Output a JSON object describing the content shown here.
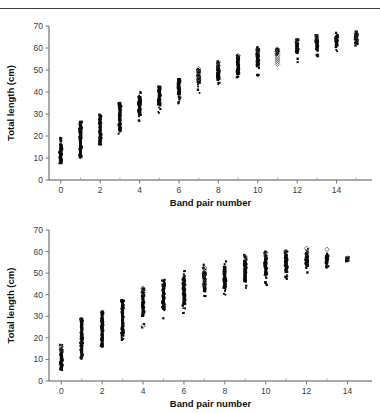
{
  "figure": {
    "background": "#ffffff",
    "rule_color": "#3a3a3a",
    "marker_filled_color": "#0b0b0b",
    "marker_open_color": "#4a4a4a"
  },
  "panels": [
    {
      "id": "top",
      "xlabel": "Band pair number",
      "ylabel": "Total length (cm)",
      "xticks": [
        0,
        2,
        4,
        6,
        8,
        10,
        12,
        14
      ],
      "xminor": [
        1,
        3,
        5,
        7,
        9,
        11,
        13,
        15
      ],
      "yticks": [
        0,
        10,
        20,
        30,
        40,
        50,
        60,
        70
      ],
      "xlim": [
        -0.6,
        15.8
      ],
      "ylim": [
        0,
        70
      ]
    },
    {
      "id": "bottom",
      "xlabel": "Band pair number",
      "ylabel": "Total length (cm)",
      "xticks": [
        0,
        2,
        4,
        6,
        8,
        10,
        12,
        14
      ],
      "xminor": [
        1,
        3,
        5,
        7,
        9,
        11,
        13
      ],
      "yticks": [
        0,
        10,
        20,
        30,
        40,
        50,
        60,
        70
      ],
      "xlim": [
        -0.6,
        15.2
      ],
      "ylim": [
        0,
        70
      ]
    }
  ],
  "chart_data": [
    {
      "type": "scatter",
      "panel": "top",
      "title": "",
      "xlabel": "Band pair number",
      "ylabel": "Total length (cm)",
      "xlim": [
        -0.6,
        15.8
      ],
      "ylim": [
        0,
        70
      ],
      "grid": false,
      "legend": "none",
      "xticks": [
        0,
        2,
        4,
        6,
        8,
        10,
        12,
        14
      ],
      "yticks": [
        0,
        10,
        20,
        30,
        40,
        50,
        60,
        70
      ],
      "notes": "Dense vertical scatter of total length against band pair number; filled squares plus a few open diamonds (notably a column of open diamonds at band pair 11).",
      "series": [
        {
          "name": "filled",
          "marker": "filled-square",
          "columns": [
            {
              "x": 0,
              "min": 7.5,
              "max": 20.0,
              "dense_min": 8.0,
              "dense_max": 16.5,
              "n": 60
            },
            {
              "x": 1,
              "min": 10.0,
              "max": 26.5,
              "dense_min": 10.5,
              "dense_max": 26.0,
              "n": 60
            },
            {
              "x": 2,
              "min": 16.0,
              "max": 30.0,
              "dense_min": 16.5,
              "dense_max": 28.5,
              "n": 60
            },
            {
              "x": 3,
              "min": 20.5,
              "max": 35.0,
              "dense_min": 22.0,
              "dense_max": 34.5,
              "n": 60
            },
            {
              "x": 4,
              "min": 26.5,
              "max": 41.0,
              "dense_min": 29.5,
              "dense_max": 38.0,
              "n": 60
            },
            {
              "x": 5,
              "min": 30.0,
              "max": 42.5,
              "dense_min": 34.0,
              "dense_max": 42.0,
              "n": 60
            },
            {
              "x": 6,
              "min": 34.5,
              "max": 46.0,
              "dense_min": 38.5,
              "dense_max": 45.5,
              "n": 60
            },
            {
              "x": 7,
              "min": 38.0,
              "max": 50.5,
              "dense_min": 44.0,
              "dense_max": 49.5,
              "n": 60
            },
            {
              "x": 8,
              "min": 43.0,
              "max": 54.0,
              "dense_min": 45.5,
              "dense_max": 53.0,
              "n": 60
            },
            {
              "x": 9,
              "min": 45.0,
              "max": 57.5,
              "dense_min": 48.0,
              "dense_max": 56.0,
              "n": 60
            },
            {
              "x": 10,
              "min": 47.0,
              "max": 60.5,
              "dense_min": 51.5,
              "dense_max": 59.5,
              "n": 60
            },
            {
              "x": 11,
              "min": 57.0,
              "max": 60.0,
              "dense_min": 57.5,
              "dense_max": 59.5,
              "n": 20
            },
            {
              "x": 12,
              "min": 52.5,
              "max": 64.0,
              "dense_min": 57.5,
              "dense_max": 63.0,
              "n": 50
            },
            {
              "x": 13,
              "min": 55.5,
              "max": 66.0,
              "dense_min": 59.0,
              "dense_max": 64.5,
              "n": 50
            },
            {
              "x": 14,
              "min": 58.5,
              "max": 67.0,
              "dense_min": 61.0,
              "dense_max": 65.5,
              "n": 50
            },
            {
              "x": 15,
              "min": 60.5,
              "max": 67.5,
              "dense_min": 62.0,
              "dense_max": 66.5,
              "n": 40
            }
          ]
        },
        {
          "name": "open",
          "marker": "open-diamond",
          "points": [
            {
              "x": 7,
              "y": 50.5
            },
            {
              "x": 7,
              "y": 49.0
            },
            {
              "x": 7,
              "y": 47.5
            },
            {
              "x": 7,
              "y": 46.0
            },
            {
              "x": 7,
              "y": 44.5
            },
            {
              "x": 8,
              "y": 53.5
            },
            {
              "x": 8,
              "y": 52.0
            },
            {
              "x": 9,
              "y": 56.5
            },
            {
              "x": 10,
              "y": 59.0
            },
            {
              "x": 11,
              "y": 59.5
            },
            {
              "x": 11,
              "y": 58.5
            },
            {
              "x": 11,
              "y": 57.5
            },
            {
              "x": 11,
              "y": 56.5
            },
            {
              "x": 11,
              "y": 55.5
            },
            {
              "x": 11,
              "y": 54.5
            },
            {
              "x": 11,
              "y": 53.5
            },
            {
              "x": 11,
              "y": 52.5
            },
            {
              "x": 12,
              "y": 63.5
            },
            {
              "x": 13,
              "y": 65.0
            },
            {
              "x": 15,
              "y": 66.5
            },
            {
              "x": 15,
              "y": 64.0
            }
          ]
        }
      ]
    },
    {
      "type": "scatter",
      "panel": "bottom",
      "title": "",
      "xlabel": "Band pair number",
      "ylabel": "Total length (cm)",
      "xlim": [
        -0.6,
        15.2
      ],
      "ylim": [
        0,
        70
      ],
      "grid": false,
      "legend": "none",
      "xticks": [
        0,
        2,
        4,
        6,
        8,
        10,
        12,
        14
      ],
      "yticks": [
        0,
        10,
        20,
        30,
        40,
        50,
        60,
        70
      ],
      "notes": "Second dense vertical scatter, shorter x range ending at band pair 14; filled squares with scattered open diamonds.",
      "series": [
        {
          "name": "filled",
          "marker": "filled-square",
          "columns": [
            {
              "x": 0,
              "min": 5.0,
              "max": 17.0,
              "dense_min": 6.0,
              "dense_max": 14.0,
              "n": 60
            },
            {
              "x": 1,
              "min": 10.0,
              "max": 29.0,
              "dense_min": 10.5,
              "dense_max": 28.5,
              "n": 60
            },
            {
              "x": 2,
              "min": 15.5,
              "max": 32.5,
              "dense_min": 16.5,
              "dense_max": 31.0,
              "n": 60
            },
            {
              "x": 3,
              "min": 19.0,
              "max": 37.5,
              "dense_min": 21.0,
              "dense_max": 37.0,
              "n": 60
            },
            {
              "x": 4,
              "min": 24.5,
              "max": 43.0,
              "dense_min": 30.0,
              "dense_max": 41.5,
              "n": 60
            },
            {
              "x": 5,
              "min": 28.0,
              "max": 47.5,
              "dense_min": 33.0,
              "dense_max": 45.0,
              "n": 60
            },
            {
              "x": 6,
              "min": 31.0,
              "max": 51.5,
              "dense_min": 35.5,
              "dense_max": 48.0,
              "n": 60
            },
            {
              "x": 7,
              "min": 35.5,
              "max": 54.0,
              "dense_min": 41.5,
              "dense_max": 51.0,
              "n": 60
            },
            {
              "x": 8,
              "min": 39.0,
              "max": 55.5,
              "dense_min": 43.0,
              "dense_max": 53.5,
              "n": 60
            },
            {
              "x": 9,
              "min": 41.5,
              "max": 58.5,
              "dense_min": 46.0,
              "dense_max": 56.0,
              "n": 60
            },
            {
              "x": 10,
              "min": 44.0,
              "max": 60.0,
              "dense_min": 49.0,
              "dense_max": 58.5,
              "n": 60
            },
            {
              "x": 11,
              "min": 46.5,
              "max": 60.5,
              "dense_min": 50.5,
              "dense_max": 59.0,
              "n": 60
            },
            {
              "x": 12,
              "min": 49.0,
              "max": 61.5,
              "dense_min": 53.5,
              "dense_max": 59.5,
              "n": 55
            },
            {
              "x": 13,
              "min": 52.5,
              "max": 60.0,
              "dense_min": 54.5,
              "dense_max": 58.5,
              "n": 35
            },
            {
              "x": 14,
              "min": 55.0,
              "max": 57.5,
              "dense_min": 55.5,
              "dense_max": 57.0,
              "n": 12
            }
          ]
        },
        {
          "name": "open",
          "marker": "open-diamond",
          "points": [
            {
              "x": 0,
              "y": 16.0
            },
            {
              "x": 0,
              "y": 14.5
            },
            {
              "x": 4,
              "y": 43.0
            },
            {
              "x": 4,
              "y": 41.0
            },
            {
              "x": 4,
              "y": 25.5
            },
            {
              "x": 7,
              "y": 52.5
            },
            {
              "x": 7,
              "y": 50.0
            },
            {
              "x": 7,
              "y": 47.5
            },
            {
              "x": 7,
              "y": 45.0
            },
            {
              "x": 9,
              "y": 57.5
            },
            {
              "x": 10,
              "y": 59.5
            },
            {
              "x": 10,
              "y": 58.0
            },
            {
              "x": 11,
              "y": 60.0
            },
            {
              "x": 12,
              "y": 61.5
            },
            {
              "x": 12,
              "y": 59.0
            },
            {
              "x": 13,
              "y": 61.0
            },
            {
              "x": 14,
              "y": 57.0
            }
          ]
        }
      ]
    }
  ]
}
